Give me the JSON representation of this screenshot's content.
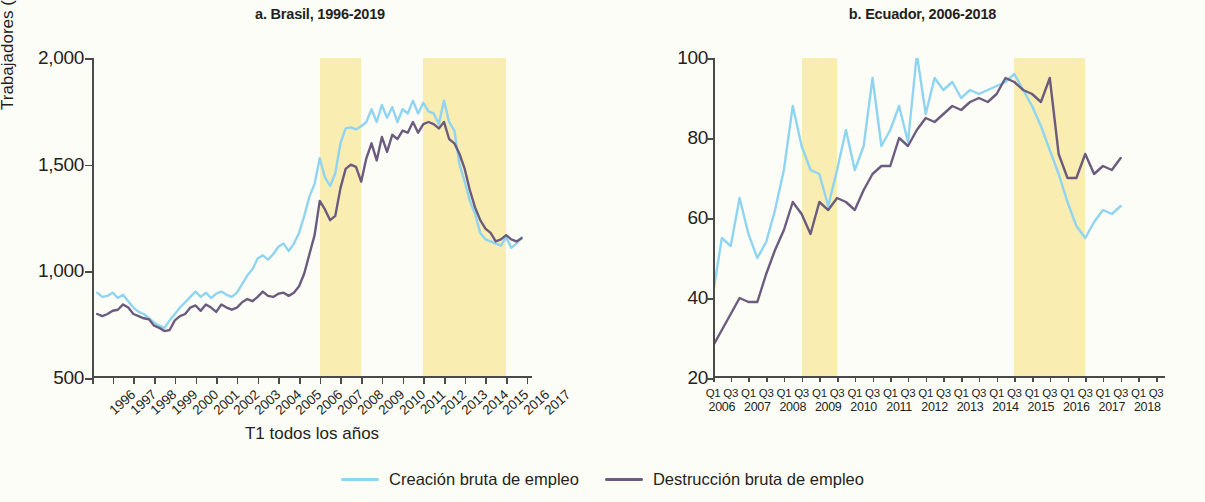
{
  "legend": {
    "creation_label": "Creación bruta de empleo",
    "destruction_label": "Destrucción bruta de empleo",
    "creation_color": "#8fd4f0",
    "destruction_color": "#6b5b7f"
  },
  "panel_a": {
    "title": "a. Brasil, 1996-2019",
    "ylabel": "Trabajadores (millares)",
    "xlabel": "T1 todos los años",
    "yticks": [
      "500",
      "1,000",
      "1,500",
      "2,000"
    ],
    "xticks": [
      "1996",
      "1997",
      "1998",
      "1999",
      "2000",
      "2001",
      "2002",
      "2003",
      "2004",
      "2005",
      "2006",
      "2007",
      "2008",
      "2009",
      "2010",
      "2011",
      "2012",
      "2013",
      "2014",
      "2015",
      "2016",
      "2017"
    ]
  },
  "panel_b": {
    "title": "b. Ecuador, 2006-2018",
    "yticks": [
      "20",
      "40",
      "60",
      "80",
      "100"
    ],
    "quarters": [
      "Q1",
      "Q3"
    ],
    "years": [
      "2006",
      "2007",
      "2008",
      "2009",
      "2010",
      "2011",
      "2012",
      "2013",
      "2014",
      "2015",
      "2016",
      "2017",
      "2018"
    ]
  },
  "chart_data": [
    {
      "type": "line",
      "title": "a. Brasil, 1996-2019",
      "xlabel": "T1 todos los años",
      "ylabel": "Trabajadores (millares)",
      "ylim": [
        500,
        2000
      ],
      "yticks": [
        500,
        1000,
        1500,
        2000
      ],
      "xlim": [
        1996,
        2017.25
      ],
      "xtick_labels": [
        "1996",
        "1997",
        "1998",
        "1999",
        "2000",
        "2001",
        "2002",
        "2003",
        "2004",
        "2005",
        "2006",
        "2007",
        "2008",
        "2009",
        "2010",
        "2011",
        "2012",
        "2013",
        "2014",
        "2015",
        "2016",
        "2017"
      ],
      "grid": false,
      "shaded_bands": [
        {
          "x0": 2007.0,
          "x1": 2009.0,
          "color": "#f9edb2"
        },
        {
          "x0": 2012.0,
          "x1": 2016.0,
          "color": "#f9edb2"
        }
      ],
      "series": [
        {
          "name": "Creación bruta de empleo",
          "color": "#8fd4f0",
          "x": [
            1996.25,
            1996.5,
            1996.75,
            1997.0,
            1997.25,
            1997.5,
            1997.75,
            1998.0,
            1998.25,
            1998.5,
            1998.75,
            1999.0,
            1999.25,
            1999.5,
            1999.75,
            2000.0,
            2000.25,
            2000.5,
            2000.75,
            2001.0,
            2001.25,
            2001.5,
            2001.75,
            2002.0,
            2002.25,
            2002.5,
            2002.75,
            2003.0,
            2003.25,
            2003.5,
            2003.75,
            2004.0,
            2004.25,
            2004.5,
            2004.75,
            2005.0,
            2005.25,
            2005.5,
            2005.75,
            2006.0,
            2006.25,
            2006.5,
            2006.75,
            2007.0,
            2007.25,
            2007.5,
            2007.75,
            2008.0,
            2008.25,
            2008.5,
            2008.75,
            2009.0,
            2009.25,
            2009.5,
            2009.75,
            2010.0,
            2010.25,
            2010.5,
            2010.75,
            2011.0,
            2011.25,
            2011.5,
            2011.75,
            2012.0,
            2012.25,
            2012.5,
            2012.75,
            2013.0,
            2013.25,
            2013.5,
            2013.75,
            2014.0,
            2014.25,
            2014.5,
            2014.75,
            2015.0,
            2015.25,
            2015.5,
            2015.75,
            2016.0,
            2016.25,
            2016.5,
            2016.75
          ],
          "y": [
            900,
            880,
            885,
            900,
            875,
            890,
            860,
            830,
            810,
            800,
            780,
            760,
            745,
            735,
            770,
            800,
            830,
            855,
            880,
            905,
            880,
            900,
            875,
            895,
            905,
            890,
            880,
            900,
            940,
            980,
            1010,
            1060,
            1075,
            1055,
            1080,
            1115,
            1130,
            1095,
            1130,
            1180,
            1260,
            1350,
            1410,
            1530,
            1440,
            1400,
            1460,
            1600,
            1670,
            1675,
            1665,
            1680,
            1700,
            1760,
            1700,
            1780,
            1720,
            1770,
            1700,
            1760,
            1740,
            1800,
            1740,
            1790,
            1750,
            1740,
            1690,
            1800,
            1700,
            1660,
            1500,
            1420,
            1330,
            1270,
            1180,
            1150,
            1140,
            1130,
            1120,
            1160,
            1110,
            1130,
            1160
          ]
        },
        {
          "name": "Destrucción bruta de empleo",
          "color": "#6b5b7f",
          "x": [
            1996.25,
            1996.5,
            1996.75,
            1997.0,
            1997.25,
            1997.5,
            1997.75,
            1998.0,
            1998.25,
            1998.5,
            1998.75,
            1999.0,
            1999.25,
            1999.5,
            1999.75,
            2000.0,
            2000.25,
            2000.5,
            2000.75,
            2001.0,
            2001.25,
            2001.5,
            2001.75,
            2002.0,
            2002.25,
            2002.5,
            2002.75,
            2003.0,
            2003.25,
            2003.5,
            2003.75,
            2004.0,
            2004.25,
            2004.5,
            2004.75,
            2005.0,
            2005.25,
            2005.5,
            2005.75,
            2006.0,
            2006.25,
            2006.5,
            2006.75,
            2007.0,
            2007.25,
            2007.5,
            2007.75,
            2008.0,
            2008.25,
            2008.5,
            2008.75,
            2009.0,
            2009.25,
            2009.5,
            2009.75,
            2010.0,
            2010.25,
            2010.5,
            2010.75,
            2011.0,
            2011.25,
            2011.5,
            2011.75,
            2012.0,
            2012.25,
            2012.5,
            2012.75,
            2013.0,
            2013.25,
            2013.5,
            2013.75,
            2014.0,
            2014.25,
            2014.5,
            2014.75,
            2015.0,
            2015.25,
            2015.5,
            2015.75,
            2016.0,
            2016.25,
            2016.5,
            2016.75
          ],
          "y": [
            800,
            790,
            800,
            815,
            820,
            845,
            830,
            800,
            790,
            780,
            775,
            745,
            735,
            720,
            725,
            770,
            790,
            800,
            830,
            840,
            815,
            845,
            830,
            810,
            845,
            830,
            820,
            830,
            855,
            870,
            860,
            880,
            905,
            885,
            880,
            895,
            900,
            885,
            900,
            930,
            990,
            1080,
            1170,
            1330,
            1290,
            1240,
            1260,
            1390,
            1480,
            1500,
            1490,
            1420,
            1530,
            1600,
            1520,
            1630,
            1560,
            1640,
            1620,
            1660,
            1650,
            1700,
            1650,
            1690,
            1700,
            1690,
            1670,
            1700,
            1620,
            1600,
            1550,
            1480,
            1380,
            1300,
            1240,
            1200,
            1180,
            1140,
            1150,
            1170,
            1150,
            1140,
            1155
          ]
        }
      ]
    },
    {
      "type": "line",
      "title": "b. Ecuador, 2006-2018",
      "xlabel": "",
      "ylabel": "",
      "ylim": [
        20,
        100
      ],
      "yticks": [
        20,
        40,
        60,
        80,
        100
      ],
      "xlim": [
        2006.0,
        2018.75
      ],
      "xtick_labels": [
        "Q1 2006",
        "Q3 2006",
        "Q1 2007",
        "Q3 2007",
        "Q1 2008",
        "Q3 2008",
        "Q1 2009",
        "Q3 2009",
        "Q1 2010",
        "Q3 2010",
        "Q1 2011",
        "Q3 2011",
        "Q1 2012",
        "Q3 2012",
        "Q1 2013",
        "Q3 2013",
        "Q1 2014",
        "Q3 2014",
        "Q1 2015",
        "Q3 2015",
        "Q1 2016",
        "Q3 2016",
        "Q1 2017",
        "Q3 2017",
        "Q1 2018",
        "Q3 2018"
      ],
      "grid": false,
      "shaded_bands": [
        {
          "x0": 2008.5,
          "x1": 2009.5,
          "color": "#f9edb2"
        },
        {
          "x0": 2014.5,
          "x1": 2016.5,
          "color": "#f9edb2"
        }
      ],
      "series": [
        {
          "name": "Creación bruta de empleo",
          "color": "#8fd4f0",
          "x": [
            2006.0,
            2006.25,
            2006.5,
            2006.75,
            2007.0,
            2007.25,
            2007.5,
            2007.75,
            2008.0,
            2008.25,
            2008.5,
            2008.75,
            2009.0,
            2009.25,
            2009.5,
            2009.75,
            2010.0,
            2010.25,
            2010.5,
            2010.75,
            2011.0,
            2011.25,
            2011.5,
            2011.75,
            2012.0,
            2012.25,
            2012.5,
            2012.75,
            2013.0,
            2013.25,
            2013.5,
            2013.75,
            2014.0,
            2014.25,
            2014.5,
            2014.75,
            2015.0,
            2015.25,
            2015.5,
            2015.75,
            2016.0,
            2016.25,
            2016.5,
            2016.75,
            2017.0,
            2017.25,
            2017.5
          ],
          "y": [
            41,
            55,
            53,
            65,
            56,
            50,
            54,
            62,
            72,
            88,
            78,
            72,
            71,
            63,
            72,
            82,
            72,
            78,
            95,
            78,
            82,
            88,
            79,
            101,
            86,
            95,
            92,
            94,
            90,
            92,
            91,
            92,
            93,
            94,
            96,
            92,
            88,
            83,
            77,
            71,
            64,
            58,
            55,
            59,
            62,
            61,
            63
          ]
        },
        {
          "name": "Destrucción bruta de empleo",
          "color": "#6b5b7f",
          "x": [
            2006.0,
            2006.25,
            2006.5,
            2006.75,
            2007.0,
            2007.25,
            2007.5,
            2007.75,
            2008.0,
            2008.25,
            2008.5,
            2008.75,
            2009.0,
            2009.25,
            2009.5,
            2009.75,
            2010.0,
            2010.25,
            2010.5,
            2010.75,
            2011.0,
            2011.25,
            2011.5,
            2011.75,
            2012.0,
            2012.25,
            2012.5,
            2012.75,
            2013.0,
            2013.25,
            2013.5,
            2013.75,
            2014.0,
            2014.25,
            2014.5,
            2014.75,
            2015.0,
            2015.25,
            2015.5,
            2015.75,
            2016.0,
            2016.25,
            2016.5,
            2016.75,
            2017.0,
            2017.25,
            2017.5
          ],
          "y": [
            28,
            32,
            36,
            40,
            39,
            39,
            46,
            52,
            57,
            64,
            61,
            56,
            64,
            62,
            65,
            64,
            62,
            67,
            71,
            73,
            73,
            80,
            78,
            82,
            85,
            84,
            86,
            88,
            87,
            89,
            90,
            89,
            91,
            95,
            94,
            92,
            91,
            89,
            95,
            76,
            70,
            70,
            76,
            71,
            73,
            72,
            75
          ]
        }
      ]
    }
  ]
}
